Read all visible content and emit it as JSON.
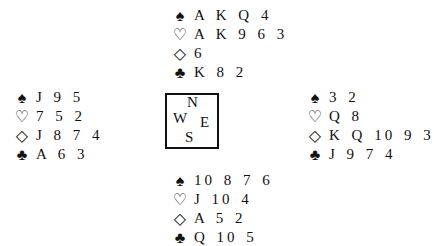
{
  "suits": {
    "spades": "♠",
    "hearts": "♡",
    "diamonds": "◇",
    "clubs": "♣"
  },
  "compass": {
    "n": "N",
    "w": "W",
    "e": "E",
    "s": "S"
  },
  "hands": {
    "north": {
      "spades": "A K Q 4",
      "hearts": "A K 9 6 3",
      "diamonds": "6",
      "clubs": "K 8 2"
    },
    "west": {
      "spades": "J 9 5",
      "hearts": "7 5 2",
      "diamonds": "J 8 7 4",
      "clubs": "A 6 3"
    },
    "east": {
      "spades": "3 2",
      "hearts": "Q 8",
      "diamonds": "K Q 10 9 3",
      "clubs": "J 9 7 4"
    },
    "south": {
      "spades": "10 8 7 6",
      "hearts": "J 10 4",
      "diamonds": "A 5 2",
      "clubs": "Q 10 5"
    }
  }
}
